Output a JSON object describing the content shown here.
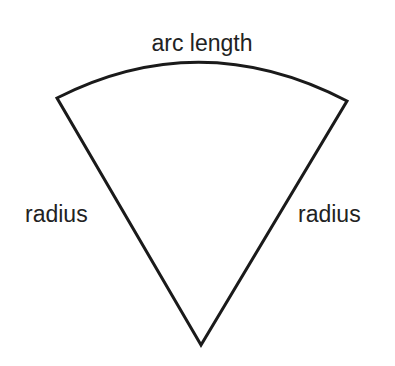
{
  "diagram": {
    "type": "circle-sector",
    "labels": {
      "arc": "arc length",
      "left_radius": "radius",
      "right_radius": "radius"
    },
    "colors": {
      "stroke": "#1a1a1a",
      "text": "#222222",
      "background": "#ffffff"
    }
  }
}
